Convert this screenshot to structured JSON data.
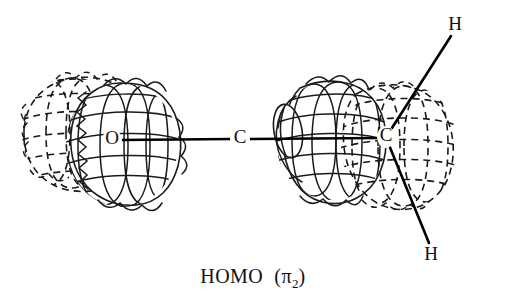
{
  "figure": {
    "title_caption": "HOMO",
    "caption_orbital_open": "(",
    "caption_orbital_symbol": "π",
    "caption_orbital_subscript": "2",
    "caption_orbital_close": ")",
    "background_color": "#ffffff",
    "line_color": "#1a1a1a",
    "bond_color": "#000000",
    "style": "hand-drawn wireframe molecular orbital",
    "molecule": "formaldehyde (H2C=O)"
  },
  "atoms": [
    {
      "id": "oxygen",
      "label": "O",
      "x": 112,
      "y": 140
    },
    {
      "id": "carbon-center",
      "label": "C",
      "x": 240,
      "y": 139
    },
    {
      "id": "carbon-right",
      "label": "C",
      "x": 386,
      "y": 137
    },
    {
      "id": "hydrogen-top",
      "label": "H",
      "x": 455,
      "y": 26
    },
    {
      "id": "hydrogen-bottom",
      "label": "H",
      "x": 431,
      "y": 256
    }
  ],
  "bonds": [
    {
      "id": "bond-o-c",
      "from": "oxygen",
      "to": "carbon-center",
      "x1": 120,
      "y1": 140,
      "x2": 232,
      "y2": 139
    },
    {
      "id": "bond-c-c",
      "from": "carbon-center",
      "to": "carbon-right",
      "x1": 250,
      "y1": 139,
      "x2": 378,
      "y2": 138
    },
    {
      "id": "bond-c-h-top",
      "from": "carbon-right",
      "to": "hydrogen-top",
      "x1": 390,
      "y1": 131,
      "x2": 451,
      "y2": 36
    },
    {
      "id": "bond-c-h-bottom",
      "from": "carbon-right",
      "to": "hydrogen-bottom",
      "x1": 389,
      "y1": 145,
      "x2": 429,
      "y2": 243
    }
  ],
  "orbital_lobes": [
    {
      "id": "lobe-oxygen-back",
      "phase": "dashed",
      "cx": 72,
      "cy": 133,
      "rx": 50,
      "ry": 56,
      "note": "rear lobe on oxygen, dashed mesh"
    },
    {
      "id": "lobe-oxygen-front",
      "phase": "solid",
      "cx": 122,
      "cy": 145,
      "rx": 56,
      "ry": 62,
      "note": "front lobe on oxygen, solid mesh"
    },
    {
      "id": "lobe-carbon-front",
      "phase": "solid",
      "cx": 332,
      "cy": 140,
      "rx": 56,
      "ry": 60,
      "note": "front lobe on carbon, solid mesh, truncated left end"
    },
    {
      "id": "lobe-carbon-back",
      "phase": "dashed",
      "cx": 400,
      "cy": 146,
      "rx": 59,
      "ry": 63,
      "note": "rear lobe on carbon, dashed mesh"
    }
  ],
  "canvas": {
    "width": 506,
    "height": 302
  }
}
